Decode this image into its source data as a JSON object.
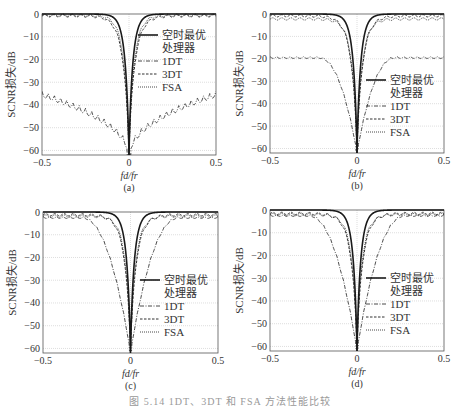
{
  "figure": {
    "caption": "图 5.14  1DT、3DT 和 FSA 方法性能比较"
  },
  "chart_data": [
    {
      "id": "a",
      "type": "line",
      "panel_label": "(a)",
      "title": "",
      "xlabel": "fd/fr",
      "ylabel": "SCNR损失/dB",
      "xlim": [
        -0.5,
        0.5
      ],
      "ylim": [
        -62,
        0
      ],
      "xticks": [
        -0.5,
        0,
        0.5
      ],
      "xtick_labels": [
        "−0.5",
        "0",
        "0.5"
      ],
      "yticks": [
        0,
        -10,
        -20,
        -30,
        -40,
        -50,
        -60
      ],
      "ytick_labels": [
        "0",
        "−10",
        "−20",
        "−30",
        "−40",
        "−50",
        "−60"
      ],
      "grid": true,
      "legend_position": "upper-right",
      "box": [
        42,
        14,
        216,
        155
      ],
      "series": [
        {
          "name": "空时最优处理器",
          "style": "solid-thick",
          "shape": "notch",
          "floor": -62,
          "width": 0.06,
          "offset": 0
        },
        {
          "name": "1DT",
          "style": "dashdot",
          "shape": "scallop",
          "edge": -34,
          "floor": -62,
          "width": 0.45,
          "offset": 0
        },
        {
          "name": "3DT",
          "style": "dashed",
          "shape": "notch",
          "floor": -62,
          "width": 0.09,
          "offset": -0.8
        },
        {
          "name": "FSA",
          "style": "dotted",
          "shape": "notch",
          "floor": -62,
          "width": 0.08,
          "offset": -0.5
        }
      ]
    },
    {
      "id": "b",
      "type": "line",
      "panel_label": "(b)",
      "title": "",
      "xlabel": "fd/fr",
      "ylabel": "SCNR损失/dB",
      "xlim": [
        -0.5,
        0.5
      ],
      "ylim": [
        -62,
        0
      ],
      "xticks": [
        -0.5,
        0,
        0.5
      ],
      "xtick_labels": [
        "−0.5",
        "0",
        "0.5"
      ],
      "yticks": [
        0,
        -10,
        -20,
        -30,
        -40,
        -50,
        -60
      ],
      "ytick_labels": [
        "0",
        "−10",
        "−20",
        "−30",
        "−40",
        "−50",
        "−60"
      ],
      "grid": true,
      "legend_position": "lower-right",
      "box": [
        270,
        14,
        444,
        153
      ],
      "series": [
        {
          "name": "空时最优处理器",
          "style": "solid-thick",
          "shape": "notch",
          "floor": -62,
          "width": 0.06,
          "offset": 0
        },
        {
          "name": "1DT",
          "style": "dashdot",
          "shape": "bowl",
          "edge": -19,
          "floor": -61,
          "width": 0.22,
          "offset": 0
        },
        {
          "name": "3DT",
          "style": "dashed",
          "shape": "notch",
          "floor": -62,
          "width": 0.09,
          "offset": -0.8
        },
        {
          "name": "FSA",
          "style": "dotted",
          "shape": "notch",
          "floor": -62,
          "width": 0.08,
          "offset": -2.2
        }
      ]
    },
    {
      "id": "c",
      "type": "line",
      "panel_label": "(c)",
      "title": "",
      "xlabel": "fd/fr",
      "ylabel": "SCNR损失/dB",
      "xlim": [
        -0.5,
        0.5
      ],
      "ylim": [
        -62,
        0
      ],
      "xticks": [
        -0.5,
        0,
        0.5
      ],
      "xtick_labels": [
        "−0.5",
        "0",
        "0.5"
      ],
      "yticks": [
        0,
        -10,
        -20,
        -30,
        -40,
        -50,
        -60
      ],
      "ytick_labels": [
        "0",
        "−10",
        "−20",
        "−30",
        "−40",
        "−50",
        "−60"
      ],
      "grid": true,
      "legend_position": "lower-right",
      "box": [
        43,
        212,
        218,
        353
      ],
      "series": [
        {
          "name": "空时最优处理器",
          "style": "solid-thick",
          "shape": "notch",
          "floor": -62,
          "width": 0.06,
          "offset": 0
        },
        {
          "name": "1DT",
          "style": "dashdot",
          "shape": "bowl",
          "edge": -2,
          "floor": -61,
          "width": 0.28,
          "offset": 0
        },
        {
          "name": "3DT",
          "style": "dashed",
          "shape": "notch",
          "floor": -62,
          "width": 0.09,
          "offset": -1.2
        },
        {
          "name": "FSA",
          "style": "dotted",
          "shape": "notch",
          "floor": -62,
          "width": 0.08,
          "offset": -1.8
        }
      ]
    },
    {
      "id": "d",
      "type": "line",
      "panel_label": "(d)",
      "title": "",
      "xlabel": "fd/fr",
      "ylabel": "SCNR损失/dB",
      "xlim": [
        -0.5,
        0.5
      ],
      "ylim": [
        -62,
        0
      ],
      "xticks": [
        -0.5,
        0,
        0.5
      ],
      "xtick_labels": [
        "−0.5",
        "0",
        "0.5"
      ],
      "yticks": [
        0,
        -10,
        -20,
        -30,
        -40,
        -50,
        -60
      ],
      "ytick_labels": [
        "0",
        "−10",
        "−20",
        "−30",
        "−40",
        "−50",
        "−60"
      ],
      "grid": true,
      "legend_position": "lower-right",
      "box": [
        270,
        210,
        444,
        351
      ],
      "series": [
        {
          "name": "空时最优处理器",
          "style": "solid-thick",
          "shape": "notch",
          "floor": -62,
          "width": 0.06,
          "offset": 0
        },
        {
          "name": "1DT",
          "style": "dashdot",
          "shape": "bowl",
          "edge": -2,
          "floor": -61,
          "width": 0.28,
          "offset": 0
        },
        {
          "name": "3DT",
          "style": "dashed",
          "shape": "notch",
          "floor": -62,
          "width": 0.09,
          "offset": -1.5
        },
        {
          "name": "FSA",
          "style": "dotted",
          "shape": "notch",
          "floor": -62,
          "width": 0.08,
          "offset": -2.0
        }
      ]
    }
  ],
  "legend": {
    "entries": [
      "空时最优",
      "处理器",
      "1DT",
      "3DT",
      "FSA"
    ]
  },
  "colors": {
    "axis": "#555555",
    "grid": "#c8c8c8",
    "line": "#1a1a1a"
  }
}
